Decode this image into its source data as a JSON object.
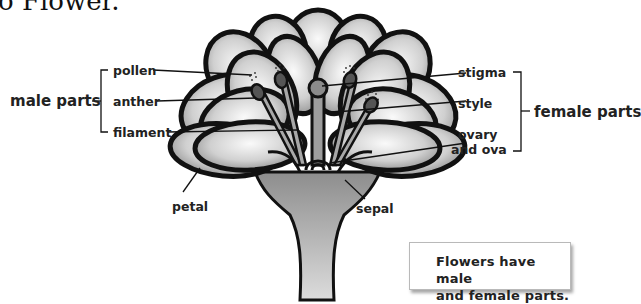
{
  "heading": "o Flower.",
  "groups": {
    "male": "male parts",
    "female": "female parts"
  },
  "labels": {
    "pollen": "pollen",
    "anther": "anther",
    "filament": "filament",
    "stigma": "stigma",
    "style": "style",
    "ovary_line1": "ovary",
    "ovary_line2": "and ova",
    "petal": "petal",
    "sepal": "sepal"
  },
  "note": {
    "line1": "Flowers have male",
    "line2": "and female parts."
  },
  "colors": {
    "outline": "#111111",
    "petal_fill_light": "#f2f2f2",
    "petal_fill_dark": "#8a8a8a",
    "stem": "#9a9a9a"
  }
}
